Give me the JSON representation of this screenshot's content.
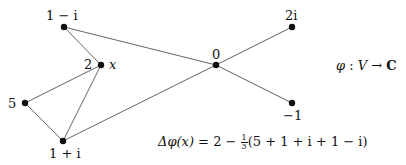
{
  "diagram": {
    "type": "graph",
    "nodes": [
      {
        "id": "n1",
        "label": "1 − i",
        "x": 64,
        "y": 27
      },
      {
        "id": "x",
        "label": "2",
        "name_label": "x",
        "x": 101,
        "y": 65
      },
      {
        "id": "n5",
        "label": "5",
        "x": 25,
        "y": 103
      },
      {
        "id": "n3",
        "label": "1 + i",
        "x": 63,
        "y": 141
      },
      {
        "id": "n0",
        "label": "0",
        "x": 216,
        "y": 65
      },
      {
        "id": "n2i",
        "label": "2i",
        "x": 292,
        "y": 27
      },
      {
        "id": "nm1",
        "label": "−1",
        "x": 292,
        "y": 103
      }
    ],
    "edges": [
      [
        "n1",
        "x"
      ],
      [
        "n1",
        "n0"
      ],
      [
        "x",
        "n5"
      ],
      [
        "x",
        "n3"
      ],
      [
        "n5",
        "n3"
      ],
      [
        "n3",
        "n0"
      ],
      [
        "n0",
        "n2i"
      ],
      [
        "n0",
        "nm1"
      ]
    ],
    "map_label": {
      "phi": "φ",
      "colon": " : ",
      "V": "V",
      "arrow": " → ",
      "C": "C"
    },
    "formula": {
      "lhs": "Δφ(x)",
      "eq": " = 2 − ",
      "frac_num": "1",
      "frac_den": "3",
      "rhs": "(5 + 1 + i + 1 − i)"
    },
    "colors": {
      "node": "#111111",
      "edge": "#555555"
    }
  }
}
